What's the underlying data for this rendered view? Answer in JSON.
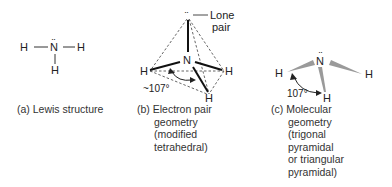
{
  "panel_a": {
    "atoms": {
      "n": "N",
      "h_left": "H",
      "h_right": "H",
      "h_bottom": "H"
    },
    "lone_pair": "··",
    "caption": "(a) Lewis structure"
  },
  "panel_b": {
    "atoms": {
      "n": "N",
      "h_left": "H",
      "h_right": "H",
      "h_bottom": "H"
    },
    "lone_pair": "··",
    "lone_pair_label": [
      "Lone",
      "pair"
    ],
    "angle_label": "~107°",
    "caption": {
      "prefix": "(b)",
      "lines": [
        "Electron pair",
        "geometry",
        "(modified",
        "tetrahedral)"
      ]
    }
  },
  "panel_c": {
    "atoms": {
      "n": "N",
      "h_left": "H",
      "h_right": "H",
      "h_bottom": "H"
    },
    "lone_pair": "··",
    "angle_label": "107°",
    "caption": {
      "prefix": "(c)",
      "lines": [
        "Molecular",
        "geometry",
        "(trigonal",
        "pyramidal",
        "or triangular",
        "pyramidal)"
      ]
    }
  },
  "colors": {
    "line": "#222222",
    "dashed": "#555555",
    "wedge": "#9a9a9a"
  }
}
